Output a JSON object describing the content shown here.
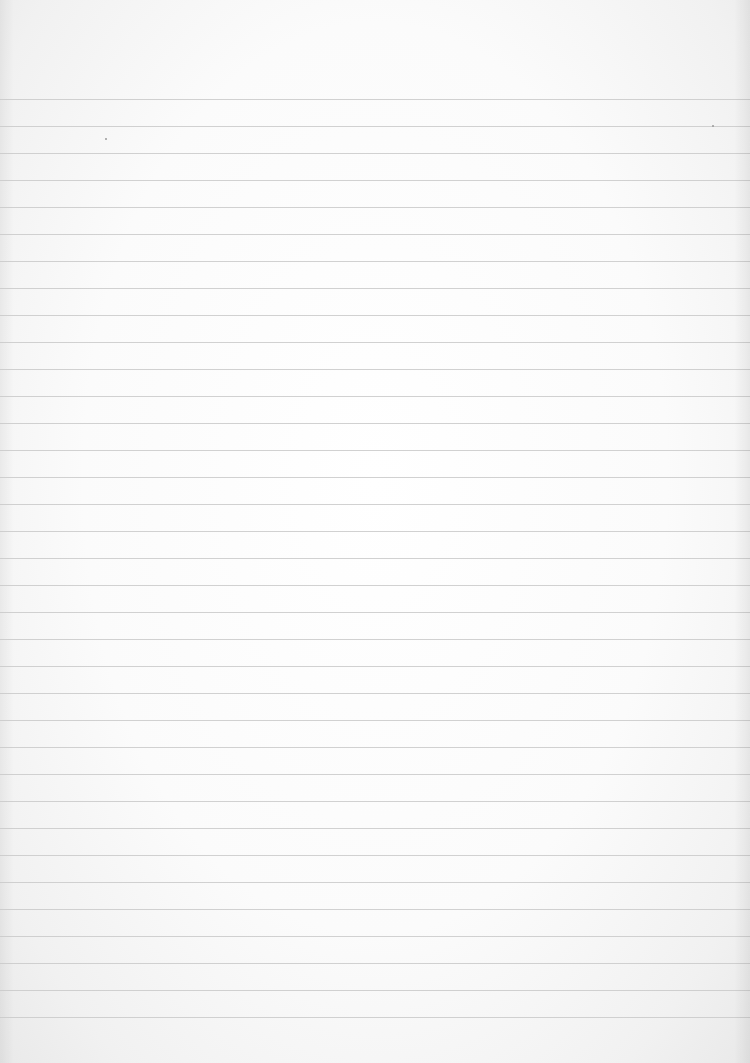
{
  "page": {
    "type": "ruled-paper",
    "background_color": "#fbfbfb",
    "rule_color": "#c9c9c9",
    "first_rule_y": 99,
    "rule_spacing_px": 27,
    "rule_count": 35
  },
  "specks": [
    {
      "x": 712,
      "y": 125
    },
    {
      "x": 105,
      "y": 138
    }
  ]
}
